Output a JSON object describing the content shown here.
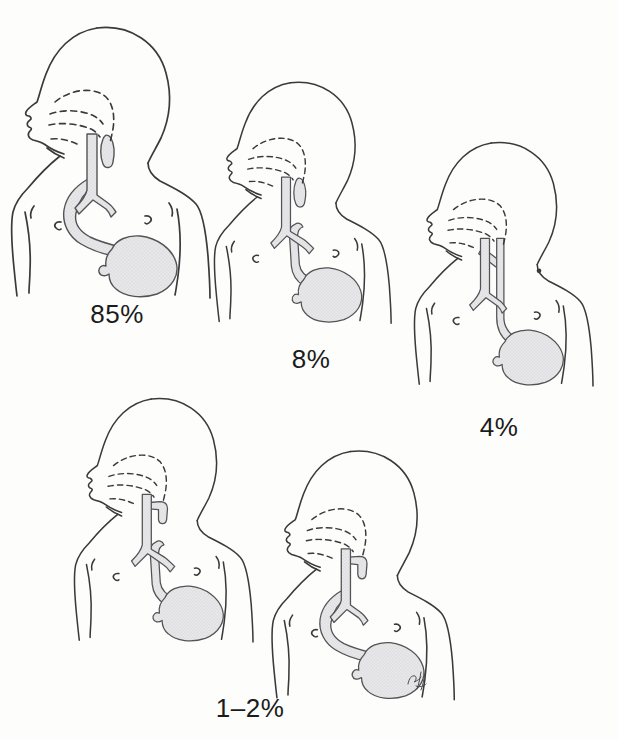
{
  "figure_labels": [
    {
      "text": "85%"
    },
    {
      "text": "8%"
    },
    {
      "text": "4%"
    },
    {
      "text": "1–2%"
    }
  ],
  "variants": [
    {
      "name": "esophageal-atresia-with-distal-fistula"
    },
    {
      "name": "esophageal-atresia-without-fistula"
    },
    {
      "name": "h-type-fistula-without-atresia"
    },
    {
      "name": "esophageal-atresia-with-proximal-fistula"
    },
    {
      "name": "esophageal-atresia-with-proximal-and-distal-fistula"
    }
  ],
  "colors": {
    "background": "#fdfdfc",
    "line": "#3a3a3c",
    "anatomy_outline": "#535355",
    "anatomy_fill": "#e9e9eb",
    "stipple_dot": "#c1c1c5",
    "label_text": "#1b1b1b",
    "signature": "#4a4a4a"
  }
}
